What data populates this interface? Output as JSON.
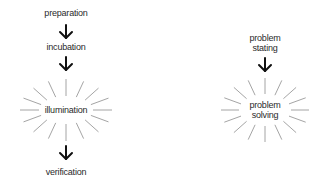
{
  "left_diagram": {
    "title": "Four-stage creative process",
    "steps": [
      {
        "label": "preparation"
      },
      {
        "label": "incubation"
      },
      {
        "label": "illumination",
        "burst": true
      },
      {
        "label": "verification"
      }
    ]
  },
  "right_diagram": {
    "title": "Two-stage problem process",
    "steps": [
      {
        "label_line1": "problem",
        "label_line2": "stating"
      },
      {
        "label_line1": "problem",
        "label_line2": "solving",
        "burst": true
      }
    ]
  },
  "colors": {
    "text": "#2a2a2a",
    "arrow": "#111111",
    "rays": "#9a9a9a",
    "background": "#ffffff"
  }
}
